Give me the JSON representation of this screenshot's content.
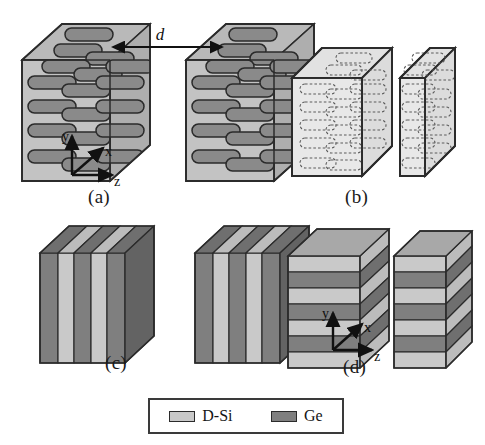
{
  "figure": {
    "type": "scientific-schematic",
    "background_color": "#ffffff"
  },
  "colors": {
    "dsi_fill": "#c9c9c9",
    "dsi_top": "#b4b4b4",
    "dsi_side": "#bdbdbd",
    "ge_fill": "#7f7f7f",
    "ge_top": "#909090",
    "ge_side": "#6e6e6e",
    "matrix_fill": "#c3c3c3",
    "matrix_transparent": "#dedede",
    "outline": "#2b2b2b",
    "axis": "#111111",
    "dashed_wire": "#555555"
  },
  "panels": [
    {
      "id": "a",
      "label": "(a)",
      "kind": "nanowire-composite-solid",
      "blocks": 2,
      "wire_rows": 7,
      "wires_per_row": 3,
      "annotation": "d",
      "annotation_kind": "separation-distance-arrow",
      "axes": [
        "y",
        "x",
        "z"
      ],
      "has_axes": true
    },
    {
      "id": "b",
      "label": "(b)",
      "kind": "nanowire-composite-transparent",
      "blocks": 2,
      "wire_rows": 7,
      "wires_per_row": 3,
      "annotation": "",
      "axes": [],
      "has_axes": false
    },
    {
      "id": "c",
      "label": "(c)",
      "kind": "vertical-superlattice",
      "blocks": 2,
      "layers": 5,
      "layer_order": [
        "Ge",
        "D-Si",
        "Ge",
        "D-Si",
        "Ge"
      ],
      "axes": [],
      "has_axes": false
    },
    {
      "id": "d",
      "label": "(d)",
      "kind": "horizontal-superlattice",
      "blocks": 2,
      "layers": 7,
      "layer_order": [
        "D-Si",
        "Ge",
        "D-Si",
        "Ge",
        "D-Si",
        "Ge",
        "D-Si"
      ],
      "axes": [
        "y",
        "x",
        "z"
      ],
      "has_axes": true
    }
  ],
  "axis_labels": {
    "x": "x",
    "y": "y",
    "z": "z"
  },
  "distance_label": "d",
  "legend": {
    "items": [
      {
        "label": "D-Si",
        "color": "#c9c9c9",
        "swatch_name": "dsi-swatch"
      },
      {
        "label": "Ge",
        "color": "#7f7f7f",
        "swatch_name": "ge-swatch"
      }
    ]
  }
}
